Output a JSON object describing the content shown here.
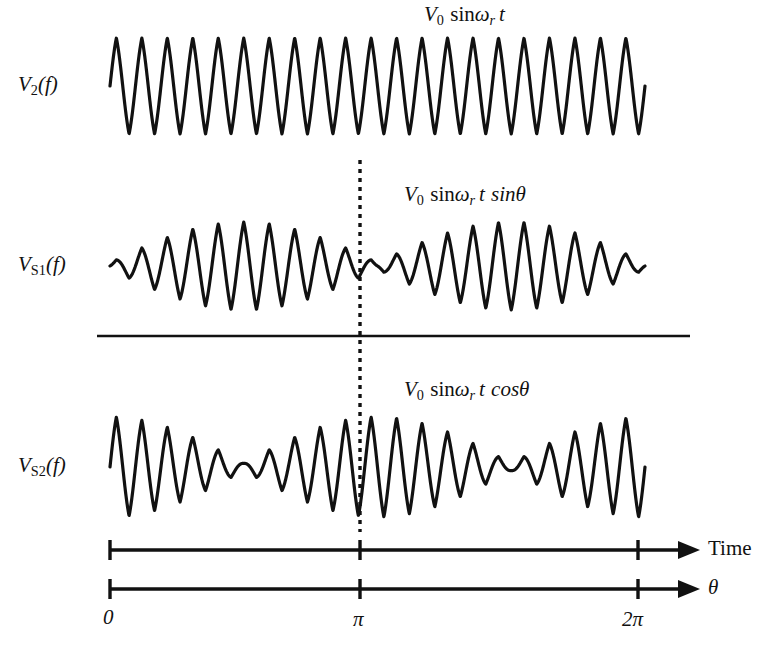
{
  "figure": {
    "title_visible": false,
    "background_color": "#ffffff",
    "stroke_color": "#111111",
    "width": 776,
    "height": 649
  },
  "rows": [
    {
      "id": "v2",
      "label_plain": "V2(f)",
      "label_main": "V",
      "label_sub": "2",
      "label_tail": "(f)",
      "formula_plain": "V0 sinωr t",
      "formula_parts": {
        "v": "V",
        "v_sub": "0",
        "sin": "sin",
        "omega": "ω",
        "omega_sub": "r",
        "t": "t",
        "trailing": ""
      }
    },
    {
      "id": "vs1",
      "label_plain": "VS1(f)",
      "label_main": "V",
      "label_sub": "S1",
      "label_tail": "(f)",
      "formula_plain": "V0 sinωr t sinθ",
      "formula_parts": {
        "v": "V",
        "v_sub": "0",
        "sin": "sin",
        "omega": "ω",
        "omega_sub": "r",
        "t": "t",
        "trailing": "sinθ"
      }
    },
    {
      "id": "vs2",
      "label_plain": "VS2(f)",
      "label_main": "V",
      "label_sub": "S2",
      "label_tail": "(f)",
      "formula_plain": "V0 sinωr t cosθ",
      "formula_parts": {
        "v": "V",
        "v_sub": "0",
        "sin": "sin",
        "omega": "ω",
        "omega_sub": "r",
        "t": "t",
        "trailing": "cosθ"
      }
    }
  ],
  "axes": [
    {
      "id": "time-axis",
      "label": "Time",
      "label_style": "upright",
      "tick_labels": [
        "",
        "",
        ""
      ]
    },
    {
      "id": "theta-axis",
      "label": "θ",
      "label_style": "italic",
      "tick_labels": [
        "0",
        "π",
        "2π"
      ]
    }
  ],
  "tick_labels": [
    "0",
    "π",
    "2π"
  ],
  "chart_data": {
    "type": "line",
    "title": "",
    "xlabel": "Time / θ",
    "ylabel": "",
    "grid": false,
    "legend": "none",
    "x_tick_values": [
      0,
      3.14159,
      6.28319
    ],
    "x_tick_labels": [
      "0",
      "π",
      "2π"
    ],
    "xlim": [
      0,
      6.28319
    ],
    "carrier_cycles_per_span": 21,
    "marker_line": {
      "at_label": "π",
      "at_value": 3.14159,
      "style": "dashed",
      "y_from_row": "v2",
      "y_to_row": "vs2"
    },
    "separator_line": {
      "style": "solid",
      "between": [
        "vs1",
        "vs2"
      ]
    },
    "series": [
      {
        "name": "V0 sinωr t",
        "row": "v2",
        "envelope": "constant",
        "envelope_formula": "1",
        "amplitude": 1.0,
        "description": "Unmodulated reference carrier at constant amplitude"
      },
      {
        "name": "V0 sinωr t sinθ",
        "row": "vs1",
        "envelope": "abs-sine",
        "envelope_formula": "|sin(θ)|",
        "amplitude": 1.0,
        "envelope_min": 0.07,
        "nulls_at": [
          "0",
          "π",
          "2π"
        ],
        "peaks_at": [
          "π/2",
          "3π/2"
        ],
        "description": "Carrier amplitude-modulated by sine of shaft angle"
      },
      {
        "name": "V0 sinωr t cosθ",
        "row": "vs2",
        "envelope": "abs-cosine",
        "envelope_formula": "|cos(θ)|",
        "amplitude": 1.0,
        "envelope_min": 0.07,
        "nulls_at": [
          "π/2",
          "3π/2"
        ],
        "peaks_at": [
          "0",
          "π",
          "2π"
        ],
        "description": "Carrier amplitude-modulated by cosine of shaft angle"
      }
    ]
  },
  "geometry": {
    "plot_left": 110,
    "plot_right": 645,
    "rows": [
      {
        "id": "v2",
        "center_y": 86,
        "half_height": 48
      },
      {
        "id": "vs1",
        "center_y": 266,
        "half_height": 44
      },
      {
        "id": "vs2",
        "center_y": 467,
        "half_height": 50
      }
    ],
    "separator_y": 336,
    "separator_x1": 97,
    "separator_x2": 690,
    "dashed_x": 360,
    "dashed_y1": 160,
    "dashed_y2": 532,
    "axis1_y": 550,
    "axis2_y": 589,
    "axis_x1": 110,
    "axis_x2": 660,
    "axis_arrow_tip": 700,
    "tick_xs": [
      110,
      360,
      638
    ]
  }
}
